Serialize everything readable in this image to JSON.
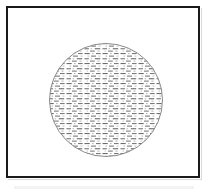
{
  "figure": {
    "caption": "",
    "background_color": "#ffffff"
  },
  "frame": {
    "name": "outer-frame",
    "stroke_color": "#1a1a1a",
    "stroke_width": 2,
    "fill_color": "#ffffff",
    "x": 6,
    "y": 6,
    "width": 194,
    "height": 172
  },
  "circle": {
    "name": "hatched-circle",
    "center_x": 106,
    "center_y": 100,
    "radius": 57,
    "stroke_color": "#8c8c8c",
    "stroke_width": 1,
    "fill_color": "#ffffff"
  },
  "hatch": {
    "name": "horizontal-dash-fill",
    "pattern_type": "horizontal-dashes",
    "dash_color": "#6e6e6e",
    "dot_color": "#b8b8b8",
    "row_spacing": 5,
    "column_spacing": 9,
    "dash_length": 5,
    "dash_thickness": 1
  },
  "artifacts": {
    "scan_smudge_color": "#f2f2f2",
    "shadow_color": "#d9d9d9"
  },
  "chart_data": {
    "type": "scatter",
    "xlabel": "",
    "ylabel": "",
    "categories": [
      "frame",
      "circle",
      "hatch-fill"
    ],
    "values": [
      1,
      1,
      1
    ],
    "annotations": []
  }
}
